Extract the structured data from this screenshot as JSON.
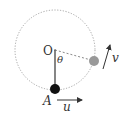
{
  "diagram": {
    "labels": {
      "center": "O",
      "lowest_point": "A",
      "angle": "θ",
      "velocity_at_angle": "v",
      "velocity_at_A": "u"
    },
    "colors": {
      "circle_path": "#9a9a9a",
      "rod": "#222222",
      "ball_at_A": "#111111",
      "ball_displaced": "#999999",
      "arrows": "#333333",
      "text": "#333333"
    }
  }
}
